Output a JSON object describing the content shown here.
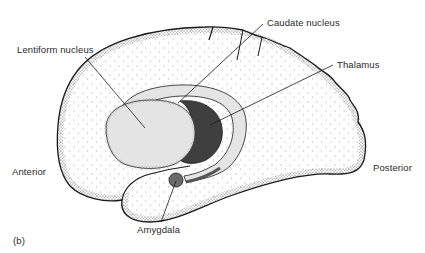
{
  "figure": {
    "panel_label": "(b)"
  },
  "labels": {
    "lentiform": "Lentiform nucleus",
    "caudate": "Caudate nucleus",
    "thalamus": "Thalamus",
    "anterior": "Anterior",
    "posterior": "Posterior",
    "amygdala": "Amygdala"
  },
  "colors": {
    "background": "#ffffff",
    "outline": "#1a1a1a",
    "stipple": "#222222",
    "lentiform_fill": "#e6e6e6",
    "caudate_fill": "#d4d4d4",
    "thalamus_fill": "#3f3f3f",
    "amygdala_fill": "#6a6a6a",
    "text": "#2a2a2a"
  }
}
